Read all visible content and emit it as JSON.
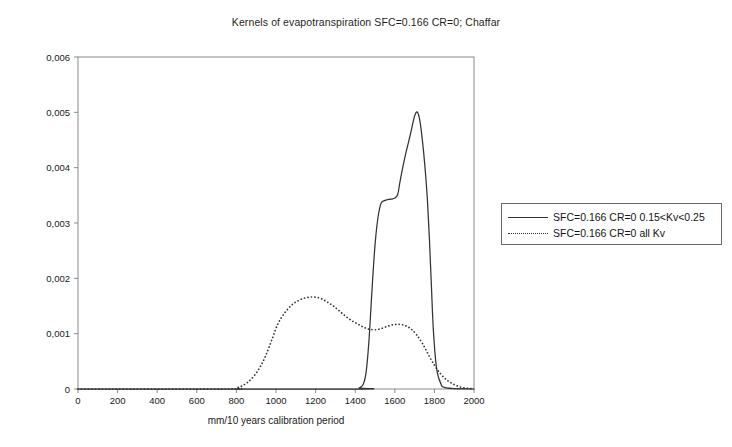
{
  "chart_data": {
    "type": "line",
    "title": "Kernels of evapotranspiration SFC=0.166 CR=0; Chaffar",
    "xlabel": "mm/10 years calibration period",
    "ylabel": "",
    "xlim": [
      0,
      2000
    ],
    "ylim": [
      0,
      0.006
    ],
    "grid": false,
    "legend_position": "right",
    "xticks": [
      "0",
      "200",
      "400",
      "600",
      "800",
      "1000",
      "1200",
      "1400",
      "1600",
      "1800",
      "2000"
    ],
    "yticks": [
      "0",
      "0,001",
      "0,002",
      "0,003",
      "0,004",
      "0,005",
      "0,006"
    ],
    "decimal_separator": ",",
    "series": [
      {
        "name": "SFC=0.166 CR=0 0.15<Kv<0.25",
        "style": "solid",
        "color": "#333333",
        "x": [
          0,
          1380,
          1420,
          1440,
          1455,
          1470,
          1485,
          1500,
          1515,
          1530,
          1545,
          1560,
          1580,
          1600,
          1615,
          1625,
          1640,
          1655,
          1670,
          1685,
          1695,
          1705,
          1715,
          1725,
          1735,
          1745,
          1755,
          1765,
          1775,
          1785,
          1795,
          1810,
          1830,
          1860,
          2000
        ],
        "y": [
          0,
          0,
          2e-05,
          8e-05,
          0.0003,
          0.0009,
          0.0018,
          0.0026,
          0.0031,
          0.00335,
          0.0034,
          0.00342,
          0.00343,
          0.00345,
          0.00352,
          0.00372,
          0.004,
          0.00425,
          0.00447,
          0.0047,
          0.00487,
          0.00498,
          0.005,
          0.00488,
          0.00463,
          0.0043,
          0.0039,
          0.0034,
          0.0027,
          0.00185,
          0.00105,
          0.0004,
          0.00012,
          2e-05,
          0
        ]
      },
      {
        "name": "SFC=0.166 CR=0 all Kv",
        "style": "dotted",
        "color": "#333333",
        "x": [
          0,
          760,
          800,
          830,
          860,
          890,
          920,
          950,
          980,
          1010,
          1045,
          1080,
          1110,
          1140,
          1170,
          1200,
          1230,
          1260,
          1290,
          1320,
          1350,
          1380,
          1410,
          1440,
          1470,
          1500,
          1530,
          1560,
          1590,
          1620,
          1650,
          1680,
          1710,
          1740,
          1770,
          1800,
          1830,
          1860,
          1890,
          1920,
          1950,
          1980,
          2000
        ],
        "y": [
          0,
          0,
          2e-05,
          6e-05,
          0.00013,
          0.00024,
          0.0004,
          0.00062,
          0.0009,
          0.00118,
          0.00138,
          0.00152,
          0.00159,
          0.00164,
          0.00166,
          0.00166,
          0.00163,
          0.00157,
          0.0015,
          0.00141,
          0.00132,
          0.00124,
          0.00118,
          0.00112,
          0.00108,
          0.00107,
          0.00109,
          0.00113,
          0.00116,
          0.00117,
          0.00115,
          0.00109,
          0.00098,
          0.00082,
          0.00062,
          0.00043,
          0.00028,
          0.00017,
          0.0001,
          5e-05,
          2e-05,
          1e-05,
          0
        ]
      }
    ],
    "legend": [
      {
        "label": "SFC=0.166 CR=0 0.15<Kv<0.25",
        "style": "solid"
      },
      {
        "label": "SFC=0.166 CR=0 all Kv",
        "style": "dotted"
      }
    ]
  }
}
